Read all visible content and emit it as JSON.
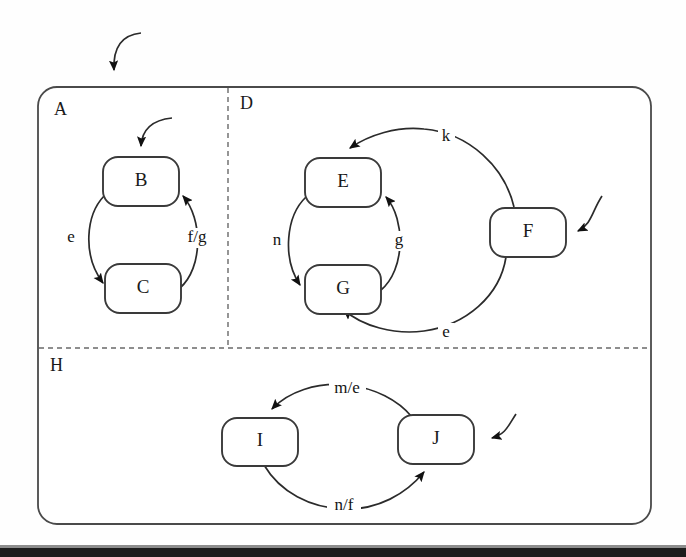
{
  "diagram": {
    "type": "statechart",
    "colors": {
      "background": "#ffffff",
      "stroke": "#2b2b2b",
      "state_stroke": "#3a3a3a",
      "divider": "#6a6a6a",
      "text": "#1a1a1a",
      "artifact_bar": "#1c1c1c"
    },
    "outer": {
      "name": "outer-composite-state",
      "x": 38,
      "y": 87,
      "width": 613,
      "height": 437,
      "corner_radius": 18
    },
    "regions": [
      {
        "id": "A",
        "label": "A",
        "label_x": 54,
        "label_y": 111
      },
      {
        "id": "D",
        "label": "D",
        "label_x": 240,
        "label_y": 105
      },
      {
        "id": "H",
        "label": "H",
        "label_x": 50,
        "label_y": 367
      }
    ],
    "dividers": [
      {
        "name": "vertical-divider-a-d",
        "x1": 228,
        "y1": 88,
        "x2": 228,
        "y2": 348
      },
      {
        "name": "horizontal-divider-h",
        "x1": 39,
        "y1": 348,
        "x2": 650,
        "y2": 348
      }
    ],
    "states": [
      {
        "id": "B",
        "label": "B",
        "region": "A",
        "x": 103,
        "y": 157,
        "width": 76,
        "height": 49
      },
      {
        "id": "C",
        "label": "C",
        "region": "A",
        "x": 105,
        "y": 264,
        "width": 76,
        "height": 49
      },
      {
        "id": "E",
        "label": "E",
        "region": "D",
        "x": 305,
        "y": 158,
        "width": 76,
        "height": 49
      },
      {
        "id": "G",
        "label": "G",
        "region": "D",
        "x": 305,
        "y": 265,
        "width": 76,
        "height": 49
      },
      {
        "id": "F",
        "label": "F",
        "region": "D",
        "x": 490,
        "y": 208,
        "width": 76,
        "height": 49
      },
      {
        "id": "I",
        "label": "I",
        "region": "H",
        "x": 222,
        "y": 418,
        "width": 76,
        "height": 48
      },
      {
        "id": "J",
        "label": "J",
        "region": "H",
        "x": 398,
        "y": 415,
        "width": 76,
        "height": 49
      }
    ],
    "transitions": [
      {
        "name": "transition-b-to-c",
        "from": "B",
        "to": "C",
        "label": "e",
        "label_x": 71,
        "label_y": 238
      },
      {
        "name": "transition-c-to-b",
        "from": "C",
        "to": "B",
        "label": "f/g",
        "label_x": 197,
        "label_y": 238
      },
      {
        "name": "transition-e-to-g",
        "from": "E",
        "to": "G",
        "label": "n",
        "label_x": 277,
        "label_y": 241
      },
      {
        "name": "transition-g-to-e",
        "from": "G",
        "to": "E",
        "label": "g",
        "label_x": 399,
        "label_y": 241
      },
      {
        "name": "transition-f-to-e",
        "from": "F",
        "to": "E",
        "label": "k",
        "label_x": 446,
        "label_y": 137
      },
      {
        "name": "transition-f-to-g",
        "from": "F",
        "to": "G",
        "label": "e",
        "label_x": 446,
        "label_y": 333
      },
      {
        "name": "transition-j-to-i",
        "from": "J",
        "to": "I",
        "label": "m/e",
        "label_x": 347,
        "label_y": 389
      },
      {
        "name": "transition-i-to-j",
        "from": "I",
        "to": "J",
        "label": "n/f",
        "label_x": 344,
        "label_y": 506
      }
    ],
    "initial_transitions": [
      {
        "name": "initial-arrow-outer",
        "target": "outer-composite-state"
      },
      {
        "name": "initial-arrow-b",
        "target": "B"
      },
      {
        "name": "initial-arrow-f",
        "target": "F"
      },
      {
        "name": "initial-arrow-j",
        "target": "J"
      }
    ]
  }
}
